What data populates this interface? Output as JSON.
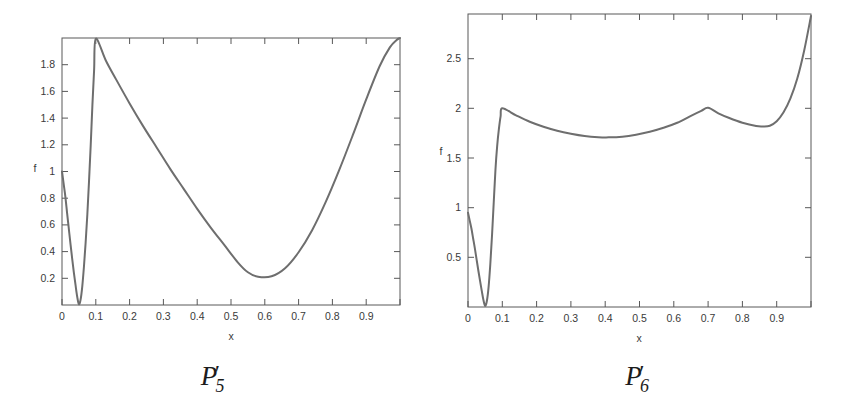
{
  "figure": {
    "background_color": "#ffffff",
    "curve_color": "#6e6e6e",
    "axis_color": "#585858",
    "text_color": "#3a3a3a"
  },
  "panels": [
    {
      "id": "panel-p5",
      "caption": {
        "base": "P",
        "subscript": "5",
        "prime": "′"
      },
      "chart_data": {
        "type": "line",
        "title": "",
        "xlabel": "x",
        "ylabel": "f",
        "xlim": [
          0.0,
          1.0
        ],
        "ylim": [
          0.0,
          2.0
        ],
        "xticks": [
          0.0,
          0.1,
          0.2,
          0.3,
          0.4,
          0.5,
          0.6,
          0.7,
          0.8,
          0.9,
          1.0
        ],
        "xticklabels": [
          "0",
          "0.1",
          "0.2",
          "0.3",
          "0.4",
          "0.5",
          "0.6",
          "0.7",
          "0.8",
          "0.9",
          ""
        ],
        "yticks": [
          0.2,
          0.4,
          0.6,
          0.8,
          1.0,
          1.2,
          1.4,
          1.6,
          1.8
        ],
        "yticklabels": [
          "0.2",
          "0.4",
          "0.6",
          "0.8",
          "1",
          "1.2",
          "1.4",
          "1.6",
          "1.8"
        ],
        "grid": false,
        "legend": "none",
        "series": [
          {
            "name": "P5'",
            "x": [
              0.0,
              0.005,
              0.01,
              0.015,
              0.02,
              0.025,
              0.03,
              0.035,
              0.04,
              0.045,
              0.05,
              0.055,
              0.06,
              0.065,
              0.07,
              0.075,
              0.08,
              0.085,
              0.09,
              0.095,
              0.1,
              0.13,
              0.16,
              0.2,
              0.24,
              0.28,
              0.32,
              0.36,
              0.4,
              0.44,
              0.48,
              0.52,
              0.55,
              0.58,
              0.62,
              0.66,
              0.7,
              0.74,
              0.78,
              0.82,
              0.86,
              0.9,
              0.94,
              0.97,
              0.99,
              1.0
            ],
            "y": [
              1.0,
              0.905,
              0.81,
              0.69,
              0.575,
              0.46,
              0.35,
              0.245,
              0.15,
              0.062,
              0.005,
              0.04,
              0.14,
              0.29,
              0.47,
              0.68,
              0.93,
              1.2,
              1.5,
              1.76,
              1.995,
              1.83,
              1.69,
              1.51,
              1.34,
              1.18,
              1.02,
              0.87,
              0.72,
              0.58,
              0.45,
              0.32,
              0.245,
              0.212,
              0.215,
              0.275,
              0.395,
              0.56,
              0.77,
              1.01,
              1.27,
              1.54,
              1.79,
              1.93,
              1.985,
              2.0
            ]
          }
        ]
      }
    },
    {
      "id": "panel-p6",
      "caption": {
        "base": "P",
        "subscript": "6",
        "prime": "′"
      },
      "chart_data": {
        "type": "line",
        "title": "",
        "xlabel": "x",
        "ylabel": "f",
        "xlim": [
          0.0,
          1.0
        ],
        "ylim": [
          0.0,
          2.95
        ],
        "xticks": [
          0.0,
          0.1,
          0.2,
          0.3,
          0.4,
          0.5,
          0.6,
          0.7,
          0.8,
          0.9,
          1.0
        ],
        "xticklabels": [
          "0",
          "0.1",
          "0.2",
          "0.3",
          "0.4",
          "0.5",
          "0.6",
          "0.7",
          "0.8",
          "0.9",
          ""
        ],
        "yticks": [
          0.5,
          1.0,
          1.5,
          2.0,
          2.5
        ],
        "yticklabels": [
          "0.5",
          "1",
          "1.5",
          "2",
          "2.5"
        ],
        "grid": false,
        "legend": "none",
        "series": [
          {
            "name": "P6'",
            "x": [
              0.0,
              0.005,
              0.01,
              0.015,
              0.02,
              0.025,
              0.03,
              0.035,
              0.04,
              0.045,
              0.05,
              0.055,
              0.06,
              0.065,
              0.07,
              0.075,
              0.08,
              0.085,
              0.09,
              0.095,
              0.1,
              0.14,
              0.18,
              0.22,
              0.26,
              0.3,
              0.34,
              0.38,
              0.41,
              0.45,
              0.49,
              0.53,
              0.57,
              0.61,
              0.65,
              0.68,
              0.7,
              0.73,
              0.76,
              0.8,
              0.84,
              0.86,
              0.88,
              0.9,
              0.92,
              0.94,
              0.96,
              0.98,
              1.0
            ],
            "y": [
              0.95,
              0.87,
              0.79,
              0.69,
              0.59,
              0.48,
              0.37,
              0.265,
              0.165,
              0.07,
              0.01,
              0.06,
              0.2,
              0.43,
              0.72,
              1.05,
              1.38,
              1.62,
              1.79,
              1.92,
              2.0,
              1.93,
              1.865,
              1.815,
              1.775,
              1.745,
              1.722,
              1.71,
              1.708,
              1.715,
              1.735,
              1.765,
              1.805,
              1.855,
              1.925,
              1.975,
              2.005,
              1.95,
              1.905,
              1.855,
              1.822,
              1.818,
              1.825,
              1.87,
              1.96,
              2.1,
              2.3,
              2.58,
              2.93
            ]
          }
        ]
      }
    }
  ]
}
